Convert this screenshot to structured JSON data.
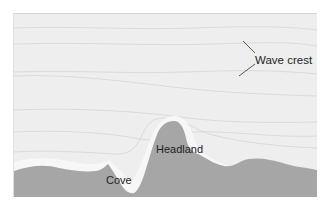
{
  "diagram": {
    "type": "coastal-wave-refraction",
    "colors": {
      "water": "#eeeeee",
      "water_band": "#f6f6f6",
      "wave_line": "#d2d2d2",
      "land": "#a6a6a6",
      "leader_line": "#444444",
      "text": "#222222"
    },
    "labels": {
      "wave_crest": "Wave crest",
      "headland": "Headland",
      "cove": "Cove"
    }
  }
}
